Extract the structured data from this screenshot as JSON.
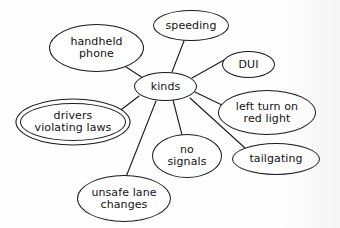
{
  "diagram": {
    "type": "mind-map",
    "title": "kinds",
    "center": {
      "id": "kinds",
      "label": "kinds",
      "shape": "ellipse",
      "border": "single",
      "x": 134,
      "y": 72,
      "w": 63,
      "h": 29,
      "font_size": 11
    },
    "nodes": [
      {
        "id": "handheld-phone",
        "label": "handheld\nphone",
        "shape": "ellipse",
        "border": "single",
        "x": 49,
        "y": 24,
        "w": 95,
        "h": 48,
        "font_size": 11
      },
      {
        "id": "speeding",
        "label": "speeding",
        "shape": "ellipse",
        "border": "single",
        "x": 153,
        "y": 10,
        "w": 76,
        "h": 31,
        "font_size": 11
      },
      {
        "id": "dui",
        "label": "DUI",
        "shape": "ellipse",
        "border": "single",
        "x": 222,
        "y": 51,
        "w": 53,
        "h": 27,
        "font_size": 11
      },
      {
        "id": "left-turn-on-red-light",
        "label": "left turn on\nred light",
        "shape": "ellipse",
        "border": "single",
        "x": 218,
        "y": 90,
        "w": 98,
        "h": 45,
        "font_size": 11
      },
      {
        "id": "tailgating",
        "label": "tailgating",
        "shape": "ellipse",
        "border": "single",
        "x": 232,
        "y": 143,
        "w": 88,
        "h": 32,
        "font_size": 11
      },
      {
        "id": "no-signals",
        "label": "no\nsignals",
        "shape": "ellipse",
        "border": "single",
        "x": 152,
        "y": 134,
        "w": 70,
        "h": 44,
        "font_size": 11
      },
      {
        "id": "unsafe-lane-changes",
        "label": "unsafe lane\nchanges",
        "shape": "ellipse",
        "border": "single",
        "x": 77,
        "y": 175,
        "w": 94,
        "h": 47,
        "font_size": 11
      },
      {
        "id": "drivers-violating-laws",
        "label": "drivers\nviolating laws",
        "shape": "ellipse",
        "border": "double",
        "x": 20,
        "y": 103,
        "w": 106,
        "h": 38,
        "font_size": 11
      }
    ],
    "edges": [
      {
        "from": "kinds",
        "to": "handheld-phone",
        "x1": 143,
        "y1": 78,
        "x2": 120,
        "y2": 63
      },
      {
        "from": "kinds",
        "to": "speeding",
        "x1": 172,
        "y1": 72,
        "x2": 184,
        "y2": 41
      },
      {
        "from": "kinds",
        "to": "dui",
        "x1": 192,
        "y1": 78,
        "x2": 224,
        "y2": 60
      },
      {
        "from": "kinds",
        "to": "left-turn-on-red-light",
        "x1": 195,
        "y1": 92,
        "x2": 226,
        "y2": 107
      },
      {
        "from": "kinds",
        "to": "tailgating",
        "x1": 190,
        "y1": 98,
        "x2": 245,
        "y2": 148
      },
      {
        "from": "kinds",
        "to": "no-signals",
        "x1": 173,
        "y1": 100,
        "x2": 182,
        "y2": 135
      },
      {
        "from": "kinds",
        "to": "unsafe-lane-changes",
        "x1": 156,
        "y1": 101,
        "x2": 126,
        "y2": 177
      },
      {
        "from": "kinds",
        "to": "drivers-violating-laws",
        "x1": 139,
        "y1": 96,
        "x2": 117,
        "y2": 113
      }
    ],
    "style": {
      "stroke_color": "#1a1a1a",
      "text_color": "#111111",
      "node_fill": "#ffffff",
      "background": "#fefefe",
      "stroke_width": 1.1
    }
  }
}
